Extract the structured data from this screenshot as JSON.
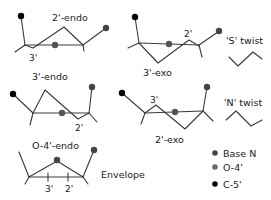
{
  "structures": [
    {
      "name": "2'-endo",
      "atom_label": "3'"
    },
    {
      "name": "3'-exo",
      "atom_label": "2'"
    },
    {
      "name": "3'-endo",
      "atom_label": "2'"
    },
    {
      "name": "2'-exo",
      "atom_label": "3'"
    },
    {
      "name": "O-4'-endo",
      "atom_labels": [
        "3'",
        "2'"
      ],
      "group": "Envelope"
    }
  ],
  "twists": [
    {
      "label": "'S' twist"
    },
    {
      "label": "'N' twist"
    }
  ],
  "legend": [
    {
      "label": "Base N",
      "color": "#454545"
    },
    {
      "label": "O-4'",
      "color": "#6a6a6a"
    },
    {
      "label": "C-5'",
      "color": "#000000"
    }
  ]
}
